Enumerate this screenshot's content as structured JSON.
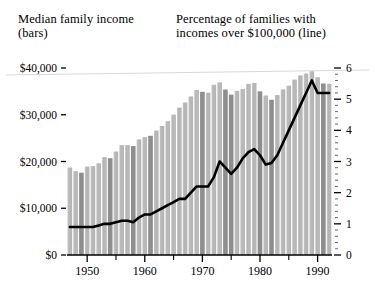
{
  "header": {
    "left_line1": "Median family income",
    "left_line2": "(bars)",
    "right_line1": "Percentage of families with",
    "right_line2": "incomes over $100,000 (line)"
  },
  "colors": {
    "bar_light": "#c2c2c2",
    "bar_dark": "#8e8e8e",
    "line": "#000000",
    "axis": "#000000",
    "background": "#ffffff"
  },
  "chart_data": {
    "type": "bar",
    "title": "",
    "subtitle": "",
    "xlabel": "",
    "ylabel": "Median family income (bars)",
    "y2label": "Percentage of families with incomes over $100,000 (line)",
    "grid": false,
    "legend": "none",
    "xlim": [
      1946,
      1993
    ],
    "ylim": [
      0,
      40000
    ],
    "y2lim": [
      0,
      6
    ],
    "ytick_labels": [
      "$0",
      "$10,000",
      "$20,000",
      "$30,000",
      "$40,000"
    ],
    "ytick_values": [
      0,
      10000,
      20000,
      30000,
      40000
    ],
    "y2tick_labels": [
      "0",
      "1",
      "2",
      "3",
      "4",
      "5",
      "6"
    ],
    "y2tick_values": [
      0,
      1,
      2,
      3,
      4,
      5,
      6
    ],
    "y2_minor_ticks": true,
    "xtick_labels": [
      "1950",
      "1960",
      "1970",
      "1980",
      "1990"
    ],
    "xtick_values": [
      1950,
      1960,
      1970,
      1980,
      1990
    ],
    "x": [
      1947,
      1948,
      1949,
      1950,
      1951,
      1952,
      1953,
      1954,
      1955,
      1956,
      1957,
      1958,
      1959,
      1960,
      1961,
      1962,
      1963,
      1964,
      1965,
      1966,
      1967,
      1968,
      1969,
      1970,
      1971,
      1972,
      1973,
      1974,
      1975,
      1976,
      1977,
      1978,
      1979,
      1980,
      1981,
      1982,
      1983,
      1984,
      1985,
      1986,
      1987,
      1988,
      1989,
      1990,
      1991,
      1992
    ],
    "series": [
      {
        "name": "Median family income (bars)",
        "kind": "bar",
        "axis": "left",
        "unit": "dollars",
        "values": [
          18700,
          17900,
          17600,
          18900,
          19000,
          19600,
          20900,
          20700,
          22100,
          23500,
          23500,
          23300,
          24700,
          25200,
          25500,
          26600,
          27600,
          28600,
          30000,
          31500,
          32600,
          33900,
          35300,
          34900,
          34700,
          36400,
          36900,
          35400,
          34300,
          35100,
          35500,
          36600,
          36800,
          35000,
          34100,
          33200,
          34200,
          35400,
          36200,
          37500,
          38400,
          38800,
          39300,
          38000,
          36700,
          36600
        ]
      },
      {
        "name": "Percentage of families with incomes over $100,000 (line)",
        "kind": "line",
        "axis": "right",
        "unit": "percent",
        "values": [
          0.9,
          0.9,
          0.9,
          0.9,
          0.9,
          0.95,
          1.0,
          1.0,
          1.05,
          1.1,
          1.1,
          1.05,
          1.2,
          1.3,
          1.3,
          1.4,
          1.5,
          1.6,
          1.7,
          1.8,
          1.8,
          2.0,
          2.2,
          2.2,
          2.2,
          2.5,
          3.0,
          2.8,
          2.6,
          2.8,
          3.1,
          3.3,
          3.4,
          3.2,
          2.9,
          2.95,
          3.2,
          3.6,
          4.0,
          4.4,
          4.8,
          5.2,
          5.6,
          5.2,
          5.2,
          5.2
        ]
      }
    ],
    "highlighted_bar_years": [
      1949,
      1954,
      1958,
      1961,
      1970,
      1974,
      1975,
      1980,
      1982,
      1991
    ],
    "note": "Dark-shaded bars mark recession years; light bars all other years."
  }
}
